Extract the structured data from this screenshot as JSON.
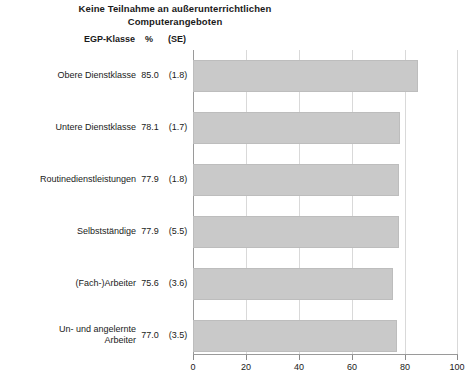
{
  "title": {
    "line1": "Keine Teilnahme an außerunterrichtlichen",
    "line2": "Computerangeboten"
  },
  "headers": {
    "class": "EGP-Klasse",
    "percent": "%",
    "se": "(SE)"
  },
  "colors": {
    "bar_fill": "#c9c9c9",
    "bar_border": "#bdbdbd",
    "gridline": "#d9d9d9",
    "axis": "#9a9a9a",
    "text": "#1a1a1a"
  },
  "rows": [
    {
      "label": "Obere Dienstklasse",
      "label_line1": "Obere Dienstklasse",
      "label_line2": "",
      "percent": "85.0",
      "se": "(1.8)",
      "value": 85.0
    },
    {
      "label": "Untere Dienstklasse",
      "label_line1": "Untere Dienstklasse",
      "label_line2": "",
      "percent": "78.1",
      "se": "(1.7)",
      "value": 78.1
    },
    {
      "label": "Routinedienstleistungen",
      "label_line1": "Routinedienstleistungen",
      "label_line2": "",
      "percent": "77.9",
      "se": "(1.8)",
      "value": 77.9
    },
    {
      "label": "Selbstständige",
      "label_line1": "Selbstständige",
      "label_line2": "",
      "percent": "77.9",
      "se": "(5.5)",
      "value": 77.9
    },
    {
      "label": "(Fach-)Arbeiter",
      "label_line1": "(Fach-)Arbeiter",
      "label_line2": "",
      "percent": "75.6",
      "se": "(3.6)",
      "value": 75.6
    },
    {
      "label": "Un- und angelernte Arbeiter",
      "label_line1": "Un- und angelernte",
      "label_line2": "Arbeiter",
      "percent": "77.0",
      "se": "(3.5)",
      "value": 77.0
    }
  ],
  "axis": {
    "ticks": [
      0,
      20,
      40,
      60,
      80,
      100
    ],
    "tick_labels": [
      "0",
      "20",
      "40",
      "60",
      "80",
      "100"
    ],
    "min": 0,
    "max": 100
  },
  "chart_data": {
    "type": "bar",
    "orientation": "horizontal",
    "title": "Keine Teilnahme an außerunterrichtlichen Computerangeboten",
    "xlabel": "",
    "ylabel": "EGP-Klasse",
    "categories": [
      "Obere Dienstklasse",
      "Untere Dienstklasse",
      "Routinedienstleistungen",
      "Selbstständige",
      "(Fach-)Arbeiter",
      "Un- und angelernte Arbeiter"
    ],
    "values": [
      85.0,
      78.1,
      77.9,
      77.9,
      75.6,
      77.0
    ],
    "standard_errors": [
      1.8,
      1.7,
      1.8,
      5.5,
      3.6,
      3.5
    ],
    "xlim": [
      0,
      100
    ],
    "xticks": [
      0,
      20,
      40,
      60,
      80,
      100
    ],
    "grid": true,
    "legend": false,
    "value_unit": "%"
  }
}
